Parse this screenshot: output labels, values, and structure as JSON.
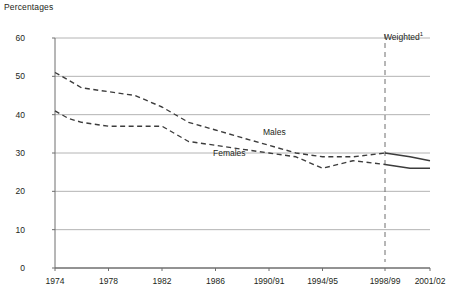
{
  "chart_data": {
    "type": "line",
    "title": "",
    "ylabel": "Percentages",
    "xlabel": "",
    "ylim": [
      0,
      60
    ],
    "ytick_step": 10,
    "yticks": [
      "0",
      "10",
      "20",
      "30",
      "40",
      "50",
      "60"
    ],
    "grid": true,
    "grid_axis": "y",
    "legend": "inline-labels",
    "x": [
      "1974",
      "1978",
      "1982",
      "1986",
      "1990/91",
      "1994/95",
      "1998/99",
      "2001/02"
    ],
    "xticks": [
      "1974",
      "1978",
      "1982",
      "1986",
      "1990/91",
      "1994/95",
      "1998/99",
      "2001/02"
    ],
    "annotations": [
      {
        "text": "Weighted",
        "superscript": "1",
        "at_x": "1998/99",
        "type": "vertical-divider-label"
      }
    ],
    "series": [
      {
        "name": "Males",
        "style_unweighted": "dashed",
        "style_weighted": "solid",
        "color": "#3c3c3c",
        "points": [
          {
            "x": "1974",
            "y": 51
          },
          {
            "x": "1975",
            "y": 49
          },
          {
            "x": "1976",
            "y": 47
          },
          {
            "x": "1978",
            "y": 46
          },
          {
            "x": "1980",
            "y": 45
          },
          {
            "x": "1982",
            "y": 42
          },
          {
            "x": "1984",
            "y": 38
          },
          {
            "x": "1986",
            "y": 36
          },
          {
            "x": "1988",
            "y": 34
          },
          {
            "x": "1990/91",
            "y": 32
          },
          {
            "x": "1992/93",
            "y": 30
          },
          {
            "x": "1994/95",
            "y": 29
          },
          {
            "x": "1996/97",
            "y": 29
          },
          {
            "x": "1998/99",
            "y": 30
          },
          {
            "x": "2000/01",
            "y": 29
          },
          {
            "x": "2001/02",
            "y": 28
          }
        ]
      },
      {
        "name": "Females",
        "style_unweighted": "dashed",
        "style_weighted": "solid",
        "color": "#3c3c3c",
        "points": [
          {
            "x": "1974",
            "y": 41
          },
          {
            "x": "1975",
            "y": 39
          },
          {
            "x": "1976",
            "y": 38
          },
          {
            "x": "1978",
            "y": 37
          },
          {
            "x": "1980",
            "y": 37
          },
          {
            "x": "1982",
            "y": 37
          },
          {
            "x": "1984",
            "y": 33
          },
          {
            "x": "1986",
            "y": 32
          },
          {
            "x": "1988",
            "y": 31
          },
          {
            "x": "1990/91",
            "y": 30
          },
          {
            "x": "1992/93",
            "y": 29
          },
          {
            "x": "1994/95",
            "y": 26
          },
          {
            "x": "1996/97",
            "y": 28
          },
          {
            "x": "1998/99",
            "y": 27
          },
          {
            "x": "2000/01",
            "y": 26
          },
          {
            "x": "2001/02",
            "y": 26
          }
        ]
      }
    ]
  },
  "labels": {
    "males": "Males",
    "females": "Females",
    "weighted": "Weighted",
    "weighted_footnote": "1"
  },
  "colors": {
    "line": "#3c3c3c",
    "grid": "#b4b4b4",
    "axis": "#6e6e6e",
    "text": "#231f20"
  }
}
